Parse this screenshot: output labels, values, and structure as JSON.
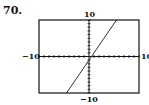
{
  "problem_number": "70.",
  "chart_data": {
    "type": "line",
    "title": "",
    "xlabel": "",
    "ylabel": "",
    "xlim": [
      -10,
      10
    ],
    "ylim": [
      -10,
      10
    ],
    "xscale": 1,
    "yscale": 1,
    "tick_labels": {
      "x_min": "−10",
      "x_max": "10",
      "y_min": "−10",
      "y_max": "10"
    },
    "grid": false,
    "series": [
      {
        "name": "y = 2x - 1",
        "x": [
          -4.5,
          5.5
        ],
        "y": [
          -10,
          10
        ]
      }
    ]
  },
  "colors": {
    "axis": "#111111",
    "line": "#333333",
    "frame": "#111111"
  }
}
